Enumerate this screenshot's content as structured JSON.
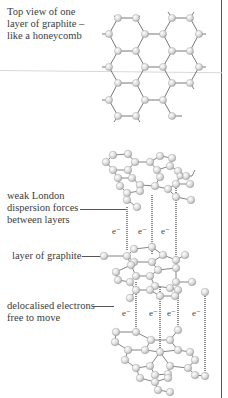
{
  "labels": {
    "top_view": "Top view of one layer of graphite – like a honeycomb",
    "top_view_lines": [
      "Top view of one",
      "layer of graphite –",
      "like a honeycomb"
    ],
    "dispersion_lines": [
      "weak London",
      "dispersion forces",
      "between layers"
    ],
    "layer": "layer of graphite",
    "delocalised_lines": [
      "delocalised electrons",
      "free to move"
    ]
  },
  "electron_symbol": "e⁻",
  "electron_labels_upper": [
    "e⁻",
    "e⁻",
    "e⁻"
  ],
  "electron_labels_lower": [
    "e⁻",
    "e⁻",
    "e⁻",
    "e⁻"
  ],
  "colors": {
    "atom": "#d9d9d9",
    "bond": "#555555",
    "dashed_bond": "#888888",
    "border": "#555555"
  }
}
